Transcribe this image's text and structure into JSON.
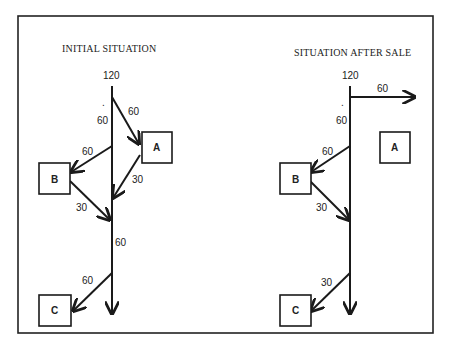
{
  "diagram": {
    "left": {
      "title": "INITIAL SITUATION",
      "source_value": "120",
      "trunk_labels": [
        "60",
        "60"
      ],
      "dot": ".",
      "nodes": [
        {
          "id": "A",
          "label": "A"
        },
        {
          "id": "B",
          "label": "B"
        },
        {
          "id": "C",
          "label": "C"
        }
      ],
      "edges": [
        {
          "from": "trunk",
          "to": "A",
          "value": "60"
        },
        {
          "from": "A",
          "to": "trunk",
          "value": "30"
        },
        {
          "from": "trunk",
          "to": "B",
          "value": "60"
        },
        {
          "from": "B",
          "to": "trunk",
          "value": "30"
        },
        {
          "from": "trunk",
          "to": "C",
          "value": "60"
        }
      ]
    },
    "right": {
      "title": "SITUATION AFTER SALE",
      "source_value": "120",
      "trunk_labels": [
        "60"
      ],
      "dot": ".",
      "nodes": [
        {
          "id": "A",
          "label": "A"
        },
        {
          "id": "B",
          "label": "B"
        },
        {
          "id": "C",
          "label": "C"
        }
      ],
      "edges": [
        {
          "from": "trunk",
          "to": "outside",
          "value": "60"
        },
        {
          "from": "trunk",
          "to": "B",
          "value": "60"
        },
        {
          "from": "B",
          "to": "trunk",
          "value": "30"
        },
        {
          "from": "trunk",
          "to": "C",
          "value": "30"
        }
      ]
    }
  }
}
